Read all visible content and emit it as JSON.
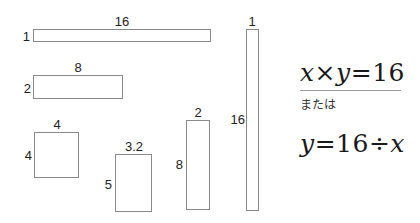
{
  "diagram": {
    "rectangles": [
      {
        "id": "r1",
        "width_label": "16",
        "height_label": "1",
        "box": {
          "x": 33,
          "y": 29,
          "w": 178,
          "h": 13
        }
      },
      {
        "id": "r2",
        "width_label": "8",
        "height_label": "2",
        "box": {
          "x": 33,
          "y": 75,
          "w": 90,
          "h": 24
        }
      },
      {
        "id": "r3",
        "width_label": "4",
        "height_label": "4",
        "box": {
          "x": 34,
          "y": 132,
          "w": 45,
          "h": 46
        }
      },
      {
        "id": "r4",
        "width_label": "3.2",
        "height_label": "5",
        "box": {
          "x": 115,
          "y": 154,
          "w": 37,
          "h": 58
        }
      },
      {
        "id": "r5",
        "width_label": "2",
        "height_label": "8",
        "box": {
          "x": 186,
          "y": 120,
          "w": 24,
          "h": 90
        }
      },
      {
        "id": "r6",
        "width_label": "1",
        "height_label": "16",
        "box": {
          "x": 246,
          "y": 29,
          "w": 13,
          "h": 182
        }
      }
    ]
  },
  "formula": {
    "line1": {
      "var_x": "x",
      "times": "×",
      "var_y": "y",
      "equals": "=",
      "value": "16"
    },
    "or_text": "または",
    "line2": {
      "var_y": "y",
      "equals": "=",
      "value": "16",
      "divide": "÷",
      "var_x": "x"
    }
  }
}
